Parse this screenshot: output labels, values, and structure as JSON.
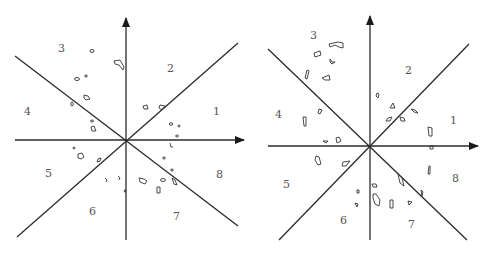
{
  "colors": {
    "lines": "#2a2a2a",
    "blobs": "#333333",
    "labels": "#555555",
    "background": "#ffffff"
  },
  "panels": [
    {
      "name": "left-sector-diagram",
      "center": [
        126,
        140
      ],
      "sector_labels": [
        {
          "text": "1",
          "x": 213,
          "y": 115
        },
        {
          "text": "2",
          "x": 167,
          "y": 72
        },
        {
          "text": "3",
          "x": 58,
          "y": 52
        },
        {
          "text": "4",
          "x": 24,
          "y": 115
        },
        {
          "text": "5",
          "x": 45,
          "y": 177
        },
        {
          "text": "6",
          "x": 89,
          "y": 215
        },
        {
          "text": "7",
          "x": 173,
          "y": 220
        },
        {
          "text": "8",
          "x": 216,
          "y": 178
        }
      ]
    },
    {
      "name": "right-sector-diagram",
      "center": [
        370,
        146
      ],
      "sector_labels": [
        {
          "text": "1",
          "x": 450,
          "y": 124
        },
        {
          "text": "2",
          "x": 405,
          "y": 74
        },
        {
          "text": "3",
          "x": 310,
          "y": 39
        },
        {
          "text": "4",
          "x": 275,
          "y": 118
        },
        {
          "text": "5",
          "x": 283,
          "y": 188
        },
        {
          "text": "6",
          "x": 340,
          "y": 224
        },
        {
          "text": "7",
          "x": 408,
          "y": 228
        },
        {
          "text": "8",
          "x": 452,
          "y": 182
        }
      ]
    }
  ],
  "sector_count": 8
}
